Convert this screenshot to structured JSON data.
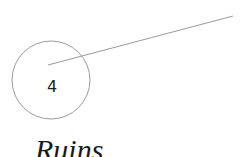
{
  "diagram": {
    "marker": {
      "number": "4",
      "circle": {
        "cx": 51,
        "cy": 80,
        "r": 39,
        "stroke": "#9a9a9a"
      },
      "leader_line": {
        "x1": 48,
        "y1": 65,
        "x2": 233,
        "y2": 16,
        "stroke": "#9a9a9a"
      }
    },
    "label": "Ruins"
  }
}
